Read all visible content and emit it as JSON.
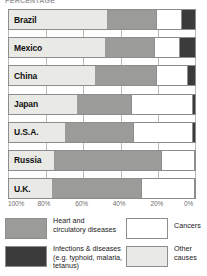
{
  "title_fragment": "PERCENTAGE",
  "chart_data": {
    "type": "bar",
    "subtype": "100% stacked horizontal bar",
    "title": "",
    "xlabel": "",
    "ylabel": "",
    "xlim": [
      100,
      0
    ],
    "x_axis_reversed": true,
    "grid": true,
    "legend_position": "bottom",
    "tick_labels": [
      "100%",
      "80%",
      "60%",
      "40%",
      "20%",
      "0%"
    ],
    "tick_values": [
      100,
      80,
      60,
      40,
      20,
      0
    ],
    "categories": [
      "Brazil",
      "Mexico",
      "China",
      "Japan",
      "U.S.A.",
      "Russia",
      "U.K."
    ],
    "series": [
      {
        "name": "Other causes",
        "key": "other",
        "color": "#e9e9e6",
        "values": [
          52,
          51,
          46,
          36,
          30,
          24,
          23
        ]
      },
      {
        "name": "Heart and circulatory diseases",
        "key": "heart",
        "color": "#9b9b99",
        "values": [
          26,
          26,
          32,
          29,
          36,
          57,
          47
        ]
      },
      {
        "name": "Cancers",
        "key": "cancers",
        "color": "#ffffff",
        "values": [
          14,
          14,
          17,
          33,
          32,
          18,
          29
        ]
      },
      {
        "name": "Infections & diseases (e.g. typhoid, malaria, tetanus)",
        "key": "infections",
        "color": "#3b3b3b",
        "values": [
          8,
          9,
          5,
          2,
          2,
          1,
          1
        ]
      }
    ]
  },
  "legend": {
    "items": [
      {
        "key": "heart",
        "label": "Heart and\ncirculatory diseases",
        "color": "#9b9b99"
      },
      {
        "key": "infections",
        "label": "Infections & diseases\n(e.g. typhoid, malaria,\ntetanus)",
        "color": "#3b3b3b"
      },
      {
        "key": "cancers",
        "label": "Cancers",
        "color": "#ffffff"
      },
      {
        "key": "other",
        "label": "Other\ncauses",
        "color": "#e9e9e6"
      }
    ]
  }
}
